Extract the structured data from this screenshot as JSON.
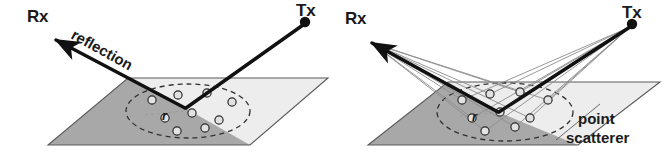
{
  "figure": {
    "background_color": "#ffffff",
    "width": 670,
    "height": 160
  },
  "colors": {
    "ink": "#1a1a1a",
    "ray_thick": "#111111",
    "ray_thin": "#8c8c8c",
    "plane_dark": "#a8a8a8",
    "plane_light": "#ededed",
    "plane_edge": "#5a5a5a",
    "ellipse_dash": "#303030",
    "scatterer_fill": "#e2e2e2",
    "scatterer_stroke": "#2b2b2b"
  },
  "panels": [
    {
      "id": "left",
      "name": "specular-reflection-panel",
      "labels": {
        "rx": "Rx",
        "tx": "Tx",
        "annotation": "reflection",
        "radius": "r"
      },
      "geometry": {
        "tx_node": [
          305,
          22
        ],
        "rx_arrow_tip": [
          50,
          37
        ],
        "bounce_point": [
          185,
          108
        ],
        "plane": [
          [
            128,
            78
          ],
          [
            328,
            78
          ],
          [
            250,
            145
          ],
          [
            48,
            145
          ]
        ],
        "ellipse_center": [
          188,
          111
        ],
        "ellipse_rx": 62,
        "ellipse_ry": 27,
        "annotation_rotation_deg": 29
      },
      "scatterers": [
        [
          152,
          100
        ],
        [
          178,
          95
        ],
        [
          207,
          93
        ],
        [
          232,
          102
        ],
        [
          165,
          118
        ],
        [
          192,
          113
        ],
        [
          219,
          120
        ],
        [
          177,
          131
        ],
        [
          205,
          128
        ]
      ]
    },
    {
      "id": "right",
      "name": "point-scatterer-panel",
      "labels": {
        "rx": "Rx",
        "tx": "Tx",
        "annotation_line1": "point",
        "annotation_line2": "scatterer",
        "radius": "r"
      },
      "geometry": {
        "tx_node": [
          632,
          24
        ],
        "rx_arrow_tip": [
          366,
          40
        ],
        "bounce_point": [
          498,
          112
        ],
        "plane": [
          [
            448,
            82
          ],
          [
            660,
            82
          ],
          [
            578,
            145
          ],
          [
            368,
            145
          ]
        ],
        "ellipse_center": [
          505,
          112
        ],
        "ellipse_rx": 68,
        "ellipse_ry": 29
      },
      "scatterers": [
        [
          462,
          100
        ],
        [
          490,
          94
        ],
        [
          520,
          92
        ],
        [
          548,
          100
        ],
        [
          472,
          118
        ],
        [
          500,
          112
        ],
        [
          530,
          118
        ],
        [
          485,
          131
        ],
        [
          515,
          127
        ]
      ]
    }
  ],
  "legend": {
    "tx_meaning": "Tx",
    "rx_meaning": "Rx",
    "scatterer_meaning": "point scatterer",
    "reflection_meaning": "reflection"
  }
}
